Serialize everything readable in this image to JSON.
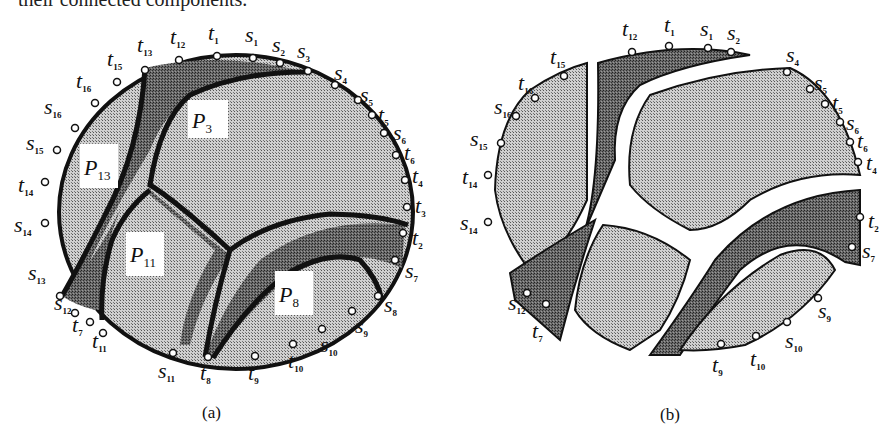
{
  "top_caption": "their connected components.",
  "figure_a": {
    "caption": "(a)",
    "regions": [
      {
        "name": "P",
        "sub": "3"
      },
      {
        "name": "P",
        "sub": "13"
      },
      {
        "name": "P",
        "sub": "11"
      },
      {
        "name": "P",
        "sub": "8"
      }
    ],
    "terminals": [
      {
        "b": "t",
        "s": "12"
      },
      {
        "b": "t",
        "s": "1"
      },
      {
        "b": "s",
        "s": "1"
      },
      {
        "b": "s",
        "s": "2"
      },
      {
        "b": "s",
        "s": "3"
      },
      {
        "b": "t",
        "s": "13"
      },
      {
        "b": "t",
        "s": "15"
      },
      {
        "b": "t",
        "s": "16"
      },
      {
        "b": "s",
        "s": "16"
      },
      {
        "b": "s",
        "s": "15"
      },
      {
        "b": "t",
        "s": "14"
      },
      {
        "b": "s",
        "s": "14"
      },
      {
        "b": "s",
        "s": "13"
      },
      {
        "b": "s",
        "s": "12"
      },
      {
        "b": "t",
        "s": "7"
      },
      {
        "b": "t",
        "s": "11"
      },
      {
        "b": "s",
        "s": "11"
      },
      {
        "b": "t",
        "s": "8"
      },
      {
        "b": "t",
        "s": "9"
      },
      {
        "b": "t",
        "s": "10"
      },
      {
        "b": "s",
        "s": "10"
      },
      {
        "b": "s",
        "s": "9"
      },
      {
        "b": "s",
        "s": "8"
      },
      {
        "b": "s",
        "s": "7"
      },
      {
        "b": "t",
        "s": "2"
      },
      {
        "b": "t",
        "s": "3"
      },
      {
        "b": "t",
        "s": "4"
      },
      {
        "b": "t",
        "s": "6"
      },
      {
        "b": "s",
        "s": "6"
      },
      {
        "b": "t",
        "s": "5"
      },
      {
        "b": "s",
        "s": "5"
      },
      {
        "b": "s",
        "s": "4"
      }
    ]
  },
  "figure_b": {
    "caption": "(b)",
    "terminals": [
      {
        "b": "t",
        "s": "12"
      },
      {
        "b": "t",
        "s": "1"
      },
      {
        "b": "s",
        "s": "1"
      },
      {
        "b": "s",
        "s": "2"
      },
      {
        "b": "t",
        "s": "15"
      },
      {
        "b": "t",
        "s": "16"
      },
      {
        "b": "s",
        "s": "16"
      },
      {
        "b": "s",
        "s": "15"
      },
      {
        "b": "t",
        "s": "14"
      },
      {
        "b": "s",
        "s": "14"
      },
      {
        "b": "s",
        "s": "12"
      },
      {
        "b": "t",
        "s": "7"
      },
      {
        "b": "t",
        "s": "9"
      },
      {
        "b": "t",
        "s": "10"
      },
      {
        "b": "s",
        "s": "10"
      },
      {
        "b": "s",
        "s": "9"
      },
      {
        "b": "s",
        "s": "7"
      },
      {
        "b": "t",
        "s": "2"
      },
      {
        "b": "t",
        "s": "4"
      },
      {
        "b": "t",
        "s": "6"
      },
      {
        "b": "s",
        "s": "6"
      },
      {
        "b": "t",
        "s": "5"
      },
      {
        "b": "s",
        "s": "5"
      },
      {
        "b": "s",
        "s": "4"
      }
    ]
  }
}
